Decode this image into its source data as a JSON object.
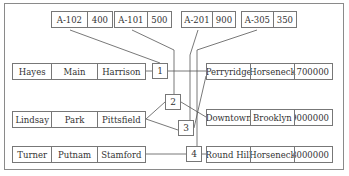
{
  "diagram": {
    "type": "linked-record diagram (customer - account - branch)",
    "accounts": [
      {
        "id": "A-102",
        "balance": "400"
      },
      {
        "id": "A-101",
        "balance": "500"
      },
      {
        "id": "A-201",
        "balance": "900"
      },
      {
        "id": "A-305",
        "balance": "350"
      }
    ],
    "customers": [
      {
        "name": "Hayes",
        "street": "Main",
        "city": "Harrison"
      },
      {
        "name": "Lindsay",
        "street": "Park",
        "city": "Pittsfield"
      },
      {
        "name": "Turner",
        "street": "Putnam",
        "city": "Stamford"
      }
    ],
    "links": [
      {
        "label": "1"
      },
      {
        "label": "2"
      },
      {
        "label": "3"
      },
      {
        "label": "4"
      }
    ],
    "branches": [
      {
        "name": "Perryridge",
        "city": "Horseneck",
        "assets": "1700000"
      },
      {
        "name": "Downtown",
        "city": "Brooklyn",
        "assets": "9000000"
      },
      {
        "name": "Round Hill",
        "city": "Horseneck",
        "assets": "8000000"
      }
    ],
    "colors": {
      "line": "#555555",
      "border": "#777777",
      "background": "#ffffff"
    }
  }
}
